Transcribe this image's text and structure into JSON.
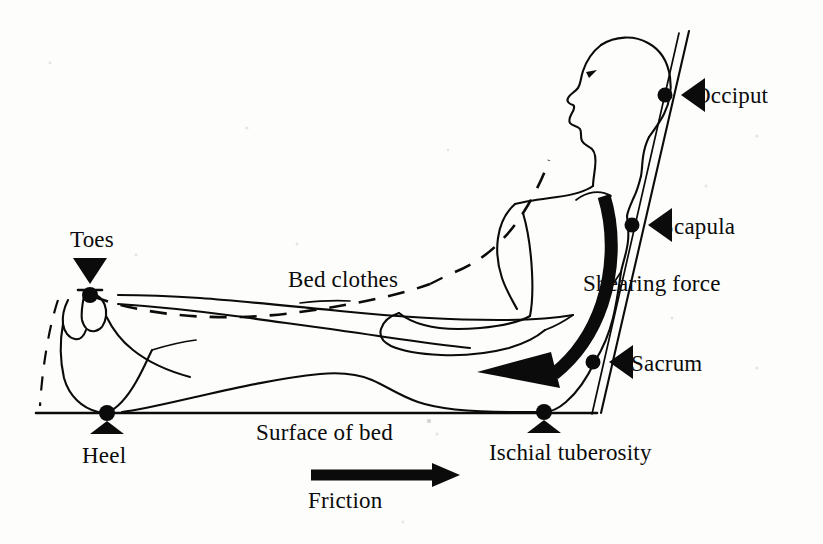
{
  "diagram": {
    "colors": {
      "ink": "#0b0b0b",
      "background": "#fdfdfb",
      "force_arrow": "#0b0b0b"
    }
  },
  "labels": {
    "occiput": "Occiput",
    "scapula": "Scapula",
    "sacrum": "Sacrum",
    "ischial_tuberosity": "Ischial tuberosity",
    "heel": "Heel",
    "toes": "Toes",
    "bed_clothes": "Bed clothes",
    "shearing_force": "Shearing force",
    "surface_of_bed": "Surface of bed",
    "friction": "Friction"
  },
  "pressure_points": [
    {
      "name": "occiput",
      "label": "Occiput",
      "marker": "dot",
      "pointer": "triangle-left",
      "dot_x": 665,
      "dot_y": 95
    },
    {
      "name": "scapula",
      "label": "Scapula",
      "marker": "dot",
      "pointer": "triangle-left",
      "dot_x": 632,
      "dot_y": 225
    },
    {
      "name": "sacrum",
      "label": "Sacrum",
      "marker": "dot",
      "pointer": "triangle-left",
      "dot_x": 593,
      "dot_y": 362
    },
    {
      "name": "ischial-tuberosity",
      "label": "Ischial tuberosity",
      "marker": "dot",
      "pointer": "triangle-up",
      "dot_x": 544,
      "dot_y": 412
    },
    {
      "name": "heel",
      "label": "Heel",
      "marker": "dot",
      "pointer": "triangle-up",
      "dot_x": 107,
      "dot_y": 413
    },
    {
      "name": "toes",
      "label": "Toes",
      "marker": "dot",
      "pointer": "triangle-down",
      "dot_x": 90,
      "dot_y": 295
    }
  ],
  "forces": [
    {
      "name": "shearing-force",
      "label": "Shearing force",
      "style": "thick-curved-arrow",
      "direction": "down-left"
    },
    {
      "name": "friction",
      "label": "Friction",
      "style": "thick-straight-arrow",
      "direction": "right"
    }
  ],
  "features": [
    {
      "name": "bed-clothes",
      "label": "Bed clothes",
      "style": "dashed-line"
    },
    {
      "name": "surface-of-bed",
      "label": "Surface of bed",
      "style": "solid-horizontal-line"
    },
    {
      "name": "bed-backrest",
      "label": "",
      "style": "solid-slanted-line"
    }
  ]
}
